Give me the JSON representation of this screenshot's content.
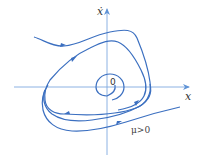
{
  "diagram": {
    "type": "phase-portrait",
    "axes": {
      "x_label": "x",
      "y_label": "ẋ",
      "origin_label": "0"
    },
    "parameter_label": "μ>0",
    "colors": {
      "curve": "#3b6fc0",
      "axis": "#5f93d6",
      "text": "#333333"
    },
    "trajectories": [
      {
        "name": "outer-trajectory-top",
        "direction": "inward toward limit cycle"
      },
      {
        "name": "limit-cycle",
        "direction": "counter-clockwise"
      },
      {
        "name": "inner-spiral",
        "direction": "outward from origin"
      },
      {
        "name": "outer-trajectory-bottom",
        "direction": "inward toward limit cycle"
      }
    ]
  }
}
